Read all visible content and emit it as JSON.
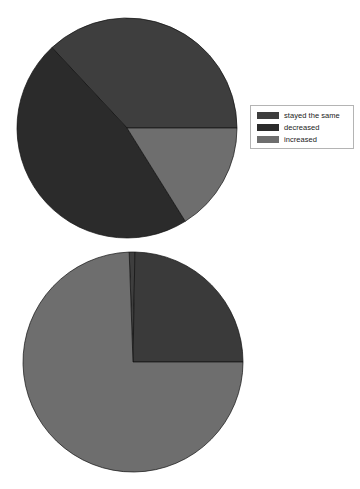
{
  "chart_data": [
    {
      "type": "pie",
      "title": "",
      "id": "top-pie",
      "categories": [
        "stayed the same",
        "decreased",
        "increased"
      ],
      "values": [
        37,
        47,
        16
      ],
      "colors": [
        "#3e3e3e",
        "#2b2b2b",
        "#6e6e6e"
      ],
      "legend_position": "right",
      "grid": false,
      "start_angle_deg": 0,
      "direction": "counterclockwise",
      "center": [
        127,
        128
      ],
      "radius": 110,
      "slices": [
        {
          "label": "stayed the same",
          "value": 37,
          "color": "#3e3e3e",
          "start_deg": 0,
          "end_deg": 133
        },
        {
          "label": "decreased",
          "value": 47,
          "color": "#2b2b2b",
          "start_deg": 133,
          "end_deg": 302
        },
        {
          "label": "increased",
          "value": 16,
          "color": "#6e6e6e",
          "start_deg": 302,
          "end_deg": 360
        }
      ]
    },
    {
      "type": "pie",
      "title": "",
      "id": "bottom-pie",
      "categories": [
        "stay the same",
        "decrease",
        "increase"
      ],
      "values": [
        1,
        25,
        74
      ],
      "colors": [
        "#3e3e3e",
        "#3a3a3a",
        "#6e6e6e"
      ],
      "legend_position": "right",
      "grid": false,
      "start_angle_deg": 0,
      "direction": "counterclockwise",
      "center": [
        133,
        362
      ],
      "radius": 110,
      "slices": [
        {
          "label": "stay the same",
          "value": 1,
          "color": "#3e3e3e",
          "start_deg": 89,
          "end_deg": 92
        },
        {
          "label": "decrease",
          "value": 25,
          "color": "#3a3a3a",
          "start_deg": 0,
          "end_deg": 89
        },
        {
          "label": "increase",
          "value": 74,
          "color": "#6e6e6e",
          "start_deg": 92,
          "end_deg": 360
        }
      ]
    }
  ],
  "charts": {
    "top": {
      "legend": {
        "items": [
          {
            "label": "stayed the same",
            "color": "#3e3e3e"
          },
          {
            "label": "decreased",
            "color": "#2b2b2b"
          },
          {
            "label": "increased",
            "color": "#6e6e6e"
          }
        ]
      }
    },
    "bottom": {
      "legend": {
        "items": [
          {
            "label": "stay the same",
            "color": "#3e3e3e"
          },
          {
            "label": "decrease",
            "color": "#3a3a3a"
          },
          {
            "label": "increase",
            "color": "#6e6e6e"
          }
        ]
      }
    }
  }
}
